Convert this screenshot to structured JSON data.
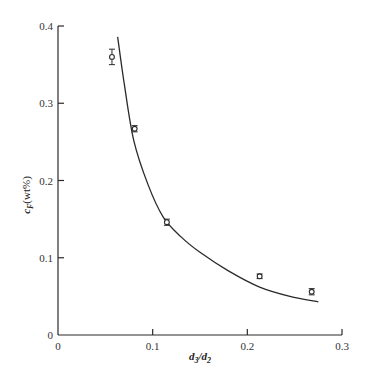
{
  "chart_data": {
    "type": "scatter",
    "title": "",
    "xlabel": "d3/d2",
    "ylabel": "cF(wt%)",
    "xlim": [
      0,
      0.3
    ],
    "ylim": [
      0,
      0.4
    ],
    "grid": false,
    "legend": null,
    "x_ticks": [
      "0",
      "0.1",
      "0.2",
      "0.3"
    ],
    "y_ticks": [
      "0",
      "0.1",
      "0.2",
      "0.3",
      "0.4"
    ],
    "series": [
      {
        "name": "measured",
        "kind": "scatter-errorbar",
        "marker": "open-circle",
        "points": [
          {
            "x": 0.057,
            "y": 0.36,
            "err": 0.01
          },
          {
            "x": 0.081,
            "y": 0.267,
            "err": 0.004
          },
          {
            "x": 0.115,
            "y": 0.146,
            "err": 0.004
          },
          {
            "x": 0.213,
            "y": 0.076,
            "err": 0.003
          },
          {
            "x": 0.268,
            "y": 0.056,
            "err": 0.004
          }
        ]
      },
      {
        "name": "model",
        "kind": "line",
        "points": [
          {
            "x": 0.063,
            "y": 0.386
          },
          {
            "x": 0.07,
            "y": 0.325
          },
          {
            "x": 0.08,
            "y": 0.252
          },
          {
            "x": 0.095,
            "y": 0.195
          },
          {
            "x": 0.111,
            "y": 0.153
          },
          {
            "x": 0.13,
            "y": 0.127
          },
          {
            "x": 0.15,
            "y": 0.107
          },
          {
            "x": 0.18,
            "y": 0.083
          },
          {
            "x": 0.213,
            "y": 0.062
          },
          {
            "x": 0.245,
            "y": 0.05
          },
          {
            "x": 0.275,
            "y": 0.043
          }
        ]
      }
    ]
  },
  "labels": {
    "xlabel_main": "d",
    "xlabel_sub1": "3",
    "xlabel_slash": "/d",
    "xlabel_sub2": "2",
    "ylabel_main": "c",
    "ylabel_sub": "F",
    "ylabel_unit": "(wt%)"
  },
  "colors": {
    "axis": "#2a2a2a",
    "line": "#2a2a2a",
    "marker": "#2a2a2a"
  }
}
